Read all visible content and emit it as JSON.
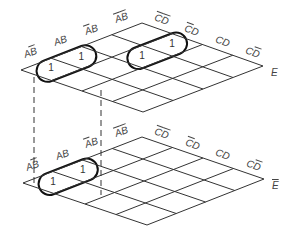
{
  "maps": [
    {
      "id": "top",
      "variable": "E",
      "variable_negated": false,
      "corners": {
        "left": [
          21,
          70
        ],
        "top": [
          142,
          23
        ],
        "right": [
          263,
          66
        ],
        "bottom": [
          143,
          112
        ]
      },
      "row_labels": [
        {
          "text": "AB",
          "over": [
            1
          ]
        },
        {
          "text": "AB",
          "over": []
        },
        {
          "text": "AB",
          "over": [
            0
          ]
        },
        {
          "text": "AB",
          "over": [
            0,
            1
          ]
        }
      ],
      "col_labels": [
        {
          "text": "CD",
          "over": [
            0,
            1
          ]
        },
        {
          "text": "CD",
          "over": [
            0
          ]
        },
        {
          "text": "CD",
          "over": []
        },
        {
          "text": "CD",
          "over": [
            1
          ]
        }
      ],
      "cells": [
        {
          "row": 0,
          "col": 0,
          "value": "1"
        },
        {
          "row": 1,
          "col": 0,
          "value": "1"
        },
        {
          "row": 1,
          "col": 2,
          "value": "1"
        },
        {
          "row": 1,
          "col": 3,
          "value": "1"
        }
      ],
      "groups": [
        {
          "cells": [
            [
              0,
              0
            ],
            [
              1,
              0
            ]
          ]
        },
        {
          "cells": [
            [
              1,
              2
            ],
            [
              1,
              3
            ]
          ]
        }
      ]
    },
    {
      "id": "bottom",
      "variable": "E",
      "variable_negated": true,
      "corners": {
        "left": [
          23,
          183
        ],
        "top": [
          142,
          137
        ],
        "right": [
          264,
          179
        ],
        "bottom": [
          147,
          225
        ]
      },
      "row_labels": [
        {
          "text": "AB",
          "over": [
            1
          ]
        },
        {
          "text": "AB",
          "over": []
        },
        {
          "text": "AB",
          "over": [
            0
          ]
        },
        {
          "text": "AB",
          "over": [
            0,
            1
          ]
        }
      ],
      "col_labels": [
        {
          "text": "CD",
          "over": [
            0,
            1
          ]
        },
        {
          "text": "CD",
          "over": [
            0
          ]
        },
        {
          "text": "CD",
          "over": []
        },
        {
          "text": "CD",
          "over": [
            1
          ]
        }
      ],
      "cells": [
        {
          "row": 0,
          "col": 0,
          "value": "1"
        },
        {
          "row": 1,
          "col": 0,
          "value": "1"
        }
      ],
      "groups": [
        {
          "cells": [
            [
              0,
              0
            ],
            [
              1,
              0
            ]
          ]
        }
      ]
    }
  ],
  "colors": {
    "grid": "#333333",
    "loop": "#111111",
    "text": "#444444"
  }
}
